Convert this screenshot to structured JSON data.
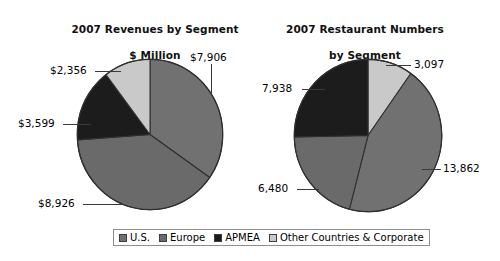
{
  "chart_data": [
    {
      "type": "pie",
      "title": "2007 Revenues by Segment\n$ Million",
      "title_line1": "2007 Revenues by Segment",
      "title_line2": "$ Million",
      "unit": "$ Million",
      "categories": [
        "U.S.",
        "Europe",
        "APMEA",
        "Other Countries & Corporate"
      ],
      "values": [
        7906,
        8926,
        3599,
        2356
      ],
      "labels": [
        "$7,906",
        "$8,926",
        "$3,599",
        "$2,356"
      ],
      "total": 22787,
      "start_angle_deg": 0,
      "direction": "clockwise",
      "legend_position": "bottom"
    },
    {
      "type": "pie",
      "title": "2007 Restaurant Numbers\nby Segment",
      "title_line1": "2007 Restaurant Numbers",
      "title_line2": "by Segment",
      "unit": "restaurants",
      "categories": [
        "Other Countries & Corporate",
        "U.S.",
        "Europe",
        "APMEA"
      ],
      "values": [
        3097,
        13862,
        6480,
        7938
      ],
      "labels": [
        "3,097",
        "13,862",
        "6,480",
        "7,938"
      ],
      "total": 31377,
      "start_angle_deg": 0,
      "direction": "clockwise",
      "legend_position": "bottom"
    }
  ],
  "charts": {
    "left": {
      "title_line1": "2007 Revenues by Segment",
      "title_line2": "$ Million",
      "callouts": {
        "us": "$7,906",
        "europe": "$8,926",
        "apmea": "$3,599",
        "other": "$2,356"
      }
    },
    "right": {
      "title_line1": "2007 Restaurant Numbers",
      "title_line2": "by Segment",
      "callouts": {
        "other": "3,097",
        "us": "13,862",
        "europe": "6,480",
        "apmea": "7,938"
      }
    }
  },
  "legend": {
    "items": [
      {
        "label": "U.S.",
        "color": "#707070"
      },
      {
        "label": "Europe",
        "color": "#6a6a6a"
      },
      {
        "label": "APMEA",
        "color": "#1a1a1a"
      },
      {
        "label": "Other Countries & Corporate",
        "color": "#c9c9c9"
      }
    ]
  },
  "colors": {
    "us": "#717171",
    "europe": "#6a6a6a",
    "apmea": "#1c1c1c",
    "other": "#c9c9c9",
    "outline": "#2f2f2f",
    "leader": "#3a3a3a",
    "text": "#000000",
    "background": "#ffffff"
  }
}
